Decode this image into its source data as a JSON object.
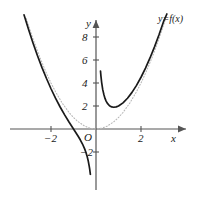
{
  "figure": {
    "title": "",
    "background_color": "#ffffff",
    "curve_color": "#1a1a1a",
    "axis_color": "#555555",
    "dotted_color": "#b9b9b9"
  },
  "axes": {
    "x_axis_name": "x",
    "y_axis_name": "y",
    "origin_label": "O",
    "x_ticks": [
      {
        "label": "−2",
        "value": -2
      },
      {
        "label": "2",
        "value": 2
      }
    ],
    "y_ticks": [
      {
        "label": "2",
        "value": 2
      },
      {
        "label": "4",
        "value": 4
      },
      {
        "label": "6",
        "value": 6
      },
      {
        "label": "8",
        "value": 8
      },
      {
        "label": "−2",
        "value": -2
      }
    ]
  },
  "annotations": {
    "curve_label": "y=f(x)"
  },
  "chart_data": {
    "type": "line",
    "title": "",
    "xlabel": "x",
    "ylabel": "y",
    "xlim": [
      -3.4,
      3.6
    ],
    "ylim": [
      -5.5,
      9.6
    ],
    "grid": false,
    "legend": "none",
    "series": [
      {
        "name": "y=f(x)",
        "style": "solid",
        "color": "#1a1a1a",
        "note": "branch left of vertical asymptote at x=0",
        "x": [
          -3.2,
          -3.0,
          -2.8,
          -2.6,
          -2.4,
          -2.2,
          -2.0,
          -1.8,
          -1.6,
          -1.4,
          -1.2,
          -1.0,
          -0.9,
          -0.8,
          -0.7,
          -0.6,
          -0.5,
          -0.45,
          -0.4,
          -0.35,
          -0.3,
          -0.28,
          -0.26,
          -0.25
        ],
        "y": [
          9.93,
          8.67,
          7.48,
          6.37,
          5.34,
          4.39,
          3.5,
          2.68,
          1.935,
          1.245,
          0.607,
          0.0,
          -0.301,
          -0.61,
          -0.939,
          -1.307,
          -1.75,
          -2.019,
          -2.34,
          -2.735,
          -3.243,
          -3.493,
          -3.8,
          -3.9375
        ]
      },
      {
        "name": "y=f(x)",
        "style": "solid",
        "color": "#1a1a1a",
        "note": "branch right of vertical asymptote at x=0, minimum near (0.79, 1.89)",
        "x": [
          0.2,
          0.22,
          0.25,
          0.3,
          0.35,
          0.4,
          0.45,
          0.5,
          0.6,
          0.7,
          0.794,
          0.9,
          1.0,
          1.2,
          1.4,
          1.6,
          1.8,
          2.0,
          2.2,
          2.4,
          2.6,
          2.8,
          3.0,
          3.15
        ],
        "y": [
          5.04,
          4.596,
          4.0625,
          3.423,
          3.0,
          2.66,
          2.425,
          2.25,
          2.027,
          1.919,
          1.889,
          1.921,
          2.0,
          2.273,
          2.674,
          3.185,
          3.795,
          4.5,
          5.294,
          6.177,
          7.145,
          8.197,
          9.333,
          10.24
        ]
      },
      {
        "name": "y=x^2",
        "style": "dotted",
        "color": "#b9b9b9",
        "note": "reference parabola shown dotted, vertex at origin",
        "x": [
          -3.1,
          -2.8,
          -2.5,
          -2.2,
          -2.0,
          -1.8,
          -1.5,
          -1.2,
          -1.0,
          -0.8,
          -0.5,
          -0.25,
          0,
          0.25,
          0.5,
          0.8,
          1.0,
          1.2,
          1.5,
          1.8,
          2.0,
          2.2,
          2.5,
          2.8,
          3.1
        ],
        "y": [
          9.61,
          7.84,
          6.25,
          4.84,
          4.0,
          3.24,
          2.25,
          1.44,
          1.0,
          0.64,
          0.25,
          0.0625,
          0,
          0.0625,
          0.25,
          0.64,
          1.0,
          1.44,
          2.25,
          3.24,
          4.0,
          4.84,
          6.25,
          7.84,
          9.61
        ]
      }
    ]
  }
}
